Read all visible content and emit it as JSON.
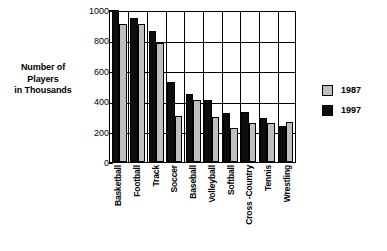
{
  "chart_data": {
    "type": "bar",
    "title": "",
    "xlabel": "",
    "ylabel": "Number of Players in Thousands",
    "ylim": [
      0,
      1000
    ],
    "yticks": [
      0,
      200,
      400,
      600,
      800,
      1000
    ],
    "grid": true,
    "legend_position": "right",
    "categories": [
      "Basketball",
      "Football",
      "Track",
      "Soccer",
      "Baseball",
      "Volleyball",
      "Softball",
      "Cross -Country",
      "Tennis",
      "Wrestling"
    ],
    "series": [
      {
        "name": "1987",
        "color": "#bfbfbf",
        "values": [
          910,
          910,
          785,
          300,
          408,
          298,
          225,
          258,
          258,
          260
        ]
      },
      {
        "name": "1997",
        "color": "#0d0d0d",
        "values": [
          1000,
          950,
          865,
          525,
          450,
          408,
          320,
          328,
          292,
          238
        ]
      }
    ]
  },
  "axis_title": {
    "line1": "Number of",
    "line2": "Players",
    "line3": "in Thousands"
  },
  "ytick_labels": [
    "1000",
    "800",
    "600",
    "400",
    "200",
    "0"
  ],
  "legend": {
    "items": [
      {
        "label": "1987",
        "color": "#bfbfbf"
      },
      {
        "label": "1997",
        "color": "#0d0d0d"
      }
    ]
  }
}
